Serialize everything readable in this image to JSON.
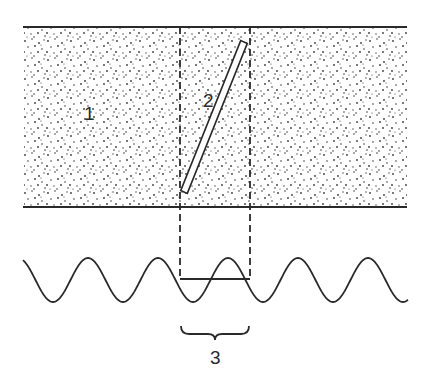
{
  "figure": {
    "labels": {
      "medium": "1",
      "tube": "2",
      "wavelength": "3"
    },
    "colors": {
      "ink": "#2a2a2a",
      "stipple": "#3a3a3a",
      "background": "#ffffff"
    },
    "medium_band": {
      "x1": 23,
      "x2": 407,
      "y_top": 27,
      "y_bottom": 207
    },
    "projection_lines_x": [
      180,
      250
    ],
    "tube": {
      "bottom": [
        184,
        192
      ],
      "top": [
        244,
        42
      ],
      "width": 7
    },
    "wave": {
      "x_start": 23,
      "x_end": 408,
      "center_y": 280,
      "amplitude": 22,
      "period": 70,
      "phase_x_crest": 88
    },
    "segment": {
      "x1": 180,
      "x2": 250,
      "y": 279
    },
    "brace": {
      "x1": 180,
      "x2": 250,
      "y": 327
    }
  }
}
